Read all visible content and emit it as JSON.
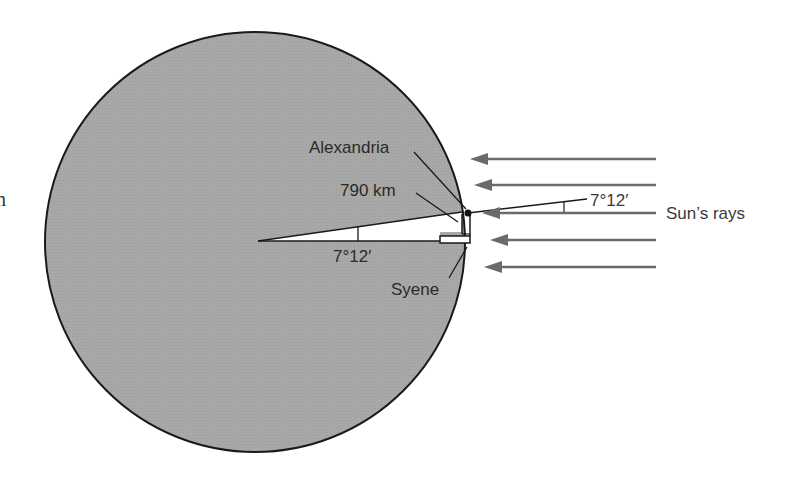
{
  "diagram": {
    "colors": {
      "earth_fill": "#a9a9a9",
      "earth_outline": "#1a1a1a",
      "ray_color": "#6a6a6a",
      "wedge_fill": "#ffffff",
      "text": "#2a2a2a"
    },
    "earth": {
      "cx": 255,
      "cy": 242,
      "r": 210
    },
    "labels": {
      "alexandria": "Alexandria",
      "distance": "790 km",
      "angle_center": "7°12′",
      "angle_rays": "7°12′",
      "syene": "Syene",
      "sun_rays": "Sun’s rays",
      "partial_left": "n"
    },
    "rays": [
      {
        "y": 159,
        "tip_x": 470,
        "end_x": 656
      },
      {
        "y": 185,
        "tip_x": 474,
        "end_x": 656
      },
      {
        "y": 213,
        "tip_x": 482,
        "end_x": 656
      },
      {
        "y": 240,
        "tip_x": 490,
        "end_x": 656
      },
      {
        "y": 267,
        "tip_x": 484,
        "end_x": 656
      }
    ]
  }
}
